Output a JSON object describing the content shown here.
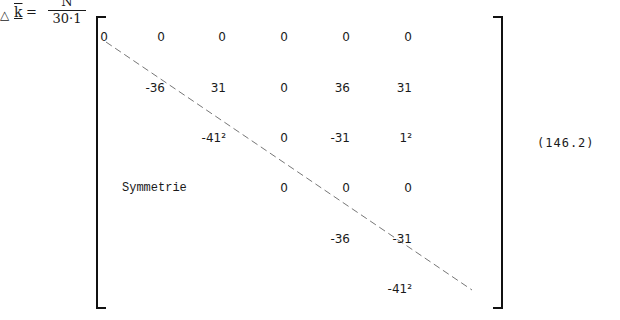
{
  "equation": {
    "lhs": {
      "delta_symbol": "△",
      "variable": "k",
      "equals": "=",
      "numerator": "N",
      "denominator": "30·1"
    },
    "matrix": {
      "rows": [
        [
          "0",
          "0",
          "0",
          "0",
          "0",
          "0"
        ],
        [
          "",
          "-36",
          "31",
          "0",
          "36",
          "31"
        ],
        [
          "",
          "",
          "-41²",
          "0",
          "-31",
          "1²"
        ],
        [
          "",
          "",
          "",
          "0",
          "0",
          "0"
        ],
        [
          "",
          "",
          "",
          "",
          "-36",
          "-31"
        ],
        [
          "",
          "",
          "",
          "",
          "",
          "-41²"
        ]
      ],
      "lower_label": "Symmetrie"
    },
    "number": "(146.2)"
  }
}
